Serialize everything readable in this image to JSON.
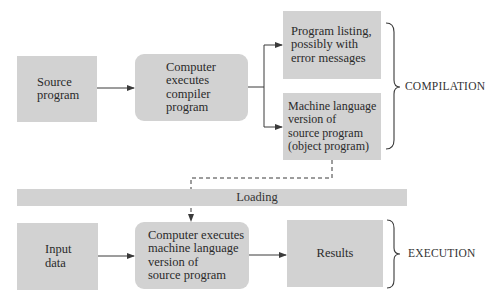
{
  "compilation": {
    "source_box": {
      "text": "Source\nprogram"
    },
    "compiler_box": {
      "text": "Computer\nexecutes\ncompiler\nprogram"
    },
    "listing_box": {
      "text": "Program listing,\npossibly with\nerror messages"
    },
    "object_box": {
      "text": "Machine language\nversion of\nsource program\n(object program)"
    },
    "phase_label": "COMPILATION"
  },
  "loading": {
    "label": "Loading"
  },
  "execution": {
    "input_box": {
      "text": "Input\ndata"
    },
    "executing_box": {
      "text": "Computer executes\nmachine language\nversion of\nsource program"
    },
    "results_box": {
      "text": "Results"
    },
    "phase_label": "EXECUTION"
  },
  "colors": {
    "box_fill": "#d2d2d2",
    "line": "#3a3a3a",
    "background": "#ffffff"
  }
}
